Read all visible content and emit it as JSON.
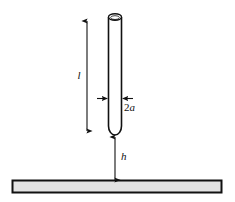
{
  "figure": {
    "title": "",
    "background_color": "#ffffff",
    "line_color": "#111111",
    "plate_fill_color": "#e3e3e3",
    "tube_fill_color": "#ffffff"
  },
  "labels": {
    "length": "l",
    "diameter_coefficient": "2",
    "diameter_symbol": "a",
    "gap_height": "h"
  },
  "elements": {
    "tube": {
      "name": "cylindrical-tube",
      "open_top": true,
      "rounded_bottom": true
    },
    "plate": {
      "name": "horizontal-plate"
    },
    "length_dimension": {
      "name": "length-dimension-arrow",
      "orientation": "vertical",
      "arrowheads": "both"
    },
    "diameter_dimension": {
      "name": "diameter-dimension-arrows",
      "orientation": "horizontal",
      "arrowheads": "inward"
    },
    "gap_dimension": {
      "name": "gap-dimension-arrow",
      "orientation": "vertical",
      "arrowheads": "both"
    }
  }
}
